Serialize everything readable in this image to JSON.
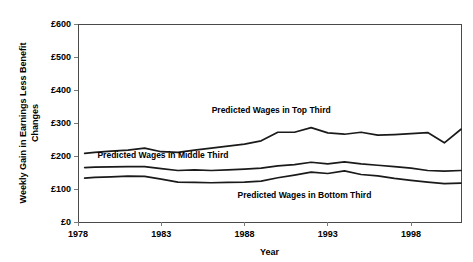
{
  "chart_data": {
    "type": "line",
    "title": "",
    "xlabel": "Year",
    "ylabel": "Weekly Gain in Earnings Less Benefit Changes",
    "ylabel_lines": [
      "Weekly Gain in Earnings Less Benefit",
      "Changes"
    ],
    "xlim": [
      1978,
      2001
    ],
    "ylim": [
      0,
      600
    ],
    "grid": false,
    "legend_position": "inline-annotations",
    "y_ticks": [
      0,
      100,
      200,
      300,
      400,
      500,
      600
    ],
    "y_tick_labels": [
      "£0",
      "£100",
      "£200",
      "£300",
      "£400",
      "£500",
      "£600"
    ],
    "x_ticks": [
      1978,
      1983,
      1988,
      1993,
      1998
    ],
    "x_tick_labels": [
      "1978",
      "1983",
      "1988",
      "1993",
      "1998"
    ],
    "currency_symbol": "£",
    "x": [
      1978.4,
      1979,
      1980,
      1981,
      1982,
      1983,
      1984,
      1985,
      1986,
      1987,
      1988,
      1989,
      1990,
      1991,
      1992,
      1993,
      1994,
      1995,
      1996,
      1997,
      1998,
      1999,
      2000,
      2001
    ],
    "series": [
      {
        "name": "Predicted Wages in Top Third",
        "label": "Predicted Wages in Top Third",
        "label_x": 1989.6,
        "label_y": 330,
        "color": "#1a1a1a",
        "values": [
          208,
          211,
          215,
          218,
          224,
          213,
          211,
          218,
          224,
          230,
          236,
          246,
          272,
          272,
          286,
          270,
          266,
          272,
          263,
          265,
          268,
          271,
          240,
          281
        ]
      },
      {
        "name": "Predicted Wages in Middle Third",
        "label": "Predicted Wages in Middle Third",
        "label_x": 1983.1,
        "label_y": 193,
        "color": "#1a1a1a",
        "values": [
          165,
          166,
          167,
          168,
          168,
          162,
          156,
          158,
          156,
          158,
          160,
          163,
          170,
          174,
          181,
          176,
          182,
          176,
          172,
          168,
          163,
          156,
          154,
          156
        ]
      },
      {
        "name": "Predicted Wages in Bottom Third",
        "label": "Predicted Wages in Bottom Third",
        "label_x": 1991.6,
        "label_y": 74,
        "color": "#1a1a1a",
        "values": [
          133,
          135,
          137,
          139,
          138,
          130,
          121,
          120,
          119,
          120,
          121,
          124,
          134,
          142,
          151,
          147,
          155,
          144,
          140,
          132,
          126,
          121,
          116,
          118
        ]
      }
    ]
  },
  "axis": {
    "x_title": "Year",
    "y_title_line1": "Weekly Gain in Earnings Less Benefit",
    "y_title_line2": "Changes"
  }
}
